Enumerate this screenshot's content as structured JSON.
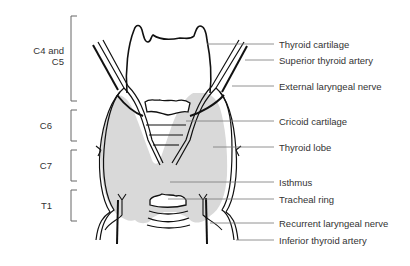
{
  "figure": {
    "vertebral_levels": [
      {
        "label": "C4 and\nC5",
        "line1": "C4 and",
        "line2": "C5"
      },
      {
        "label": "C6"
      },
      {
        "label": "C7"
      },
      {
        "label": "T1"
      }
    ],
    "structures": [
      {
        "label": "Thyroid cartilage"
      },
      {
        "label": "Superior thyroid artery"
      },
      {
        "label": "External laryngeal nerve"
      },
      {
        "label": "Cricoid cartilage"
      },
      {
        "label": "Thyroid lobe"
      },
      {
        "label": "Isthmus"
      },
      {
        "label": "Tracheal ring"
      },
      {
        "label": "Recurrent laryngeal nerve"
      },
      {
        "label": "Inferior thyroid artery"
      }
    ],
    "colors": {
      "gland_fill": "#d9d9d9",
      "outline": "#111111",
      "leader": "#777777",
      "text": "#333333"
    }
  }
}
